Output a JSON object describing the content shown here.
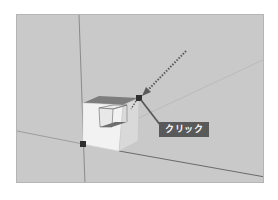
{
  "viewport": {
    "background": "#c9c9c9",
    "axis_color": "#6f6f6f",
    "object": "cube-with-inner-cutout",
    "snap_points": [
      {
        "name": "top-right-corner",
        "x": 138,
        "y": 97
      },
      {
        "name": "origin-corner",
        "x": 82,
        "y": 143
      }
    ]
  },
  "callout": {
    "label": "クリック",
    "background": "#595959",
    "text_color": "#ffffff"
  },
  "move_arrow": {
    "style": "dotted",
    "color": "#5a5a5a"
  }
}
